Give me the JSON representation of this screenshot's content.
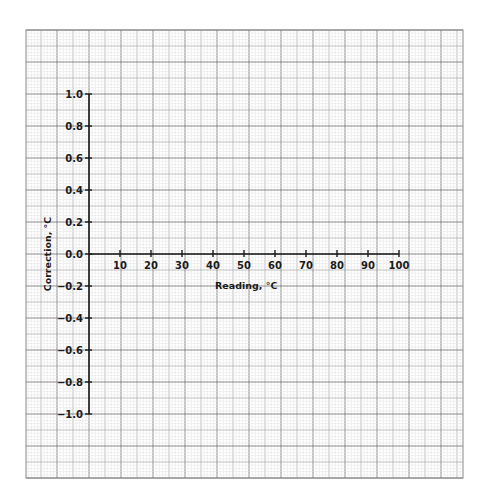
{
  "chart_data": {
    "type": "line",
    "title": "",
    "xlabel": "Reading, °C",
    "ylabel": "Correction, °C",
    "xlim": [
      0,
      100
    ],
    "ylim": [
      -1.0,
      1.0
    ],
    "x_ticks": [
      10,
      20,
      30,
      40,
      50,
      60,
      70,
      80,
      90,
      100
    ],
    "x_tick_labels": [
      "10",
      "20",
      "30",
      "40",
      "50",
      "60",
      "70",
      "80",
      "90",
      "100"
    ],
    "y_ticks": [
      1.0,
      0.8,
      0.6,
      0.4,
      0.2,
      0.0,
      -0.2,
      -0.4,
      -0.6,
      -0.8,
      -1.0
    ],
    "y_tick_labels": [
      "1.0",
      "0.8",
      "0.6",
      "0.4",
      "0.2",
      "0.0",
      "−0.2",
      "−0.4",
      "−0.6",
      "−0.8",
      "−1.0"
    ],
    "series": [],
    "grid": true,
    "grid_style": "graph paper (major, medium and fine minor lines)",
    "legend": "none",
    "background": "#ffffff",
    "grid_color_major": "#8a8a8a",
    "grid_color_minor": "#cfcfcf",
    "axis_color": "#1a1a1a"
  }
}
